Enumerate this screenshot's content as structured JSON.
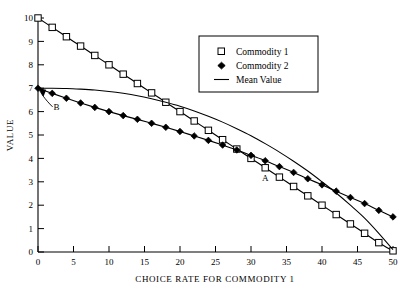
{
  "chart_data": {
    "type": "line",
    "title": "",
    "xlabel": "CHOICE RATE FOR COMMODITY 1",
    "ylabel": "VALUE",
    "xlim": [
      0,
      50
    ],
    "ylim": [
      0,
      10
    ],
    "xticks": [
      "0",
      "5",
      "10",
      "15",
      "20",
      "25",
      "30",
      "35",
      "40",
      "45",
      "50"
    ],
    "yticks": [
      "0",
      "1",
      "2",
      "3",
      "4",
      "5",
      "6",
      "7",
      "8",
      "9",
      "10"
    ],
    "grid": false,
    "legend_position": "upper-right",
    "x": [
      0,
      2,
      4,
      6,
      8,
      10,
      12,
      14,
      16,
      18,
      20,
      22,
      24,
      26,
      28,
      30,
      32,
      34,
      36,
      38,
      40,
      42,
      44,
      46,
      48,
      50
    ],
    "series": [
      {
        "name": "Commodity 1",
        "marker": "open-square",
        "values": [
          10.0,
          9.6,
          9.2,
          8.8,
          8.4,
          8.0,
          7.6,
          7.2,
          6.8,
          6.4,
          6.0,
          5.6,
          5.2,
          4.8,
          4.4,
          4.0,
          3.6,
          3.2,
          2.8,
          2.4,
          2.0,
          1.6,
          1.2,
          0.8,
          0.4,
          0.05
        ]
      },
      {
        "name": "Commodity 2",
        "marker": "filled-diamond",
        "values": [
          7.0,
          6.78,
          6.57,
          6.37,
          6.18,
          6.0,
          5.83,
          5.67,
          5.5,
          5.33,
          5.15,
          4.96,
          4.77,
          4.57,
          4.36,
          4.13,
          3.9,
          3.65,
          3.4,
          3.13,
          2.87,
          2.6,
          2.33,
          2.07,
          1.78,
          1.5
        ]
      },
      {
        "name": "Mean Value",
        "marker": "none",
        "values": [
          7.0,
          7.0,
          6.99,
          6.96,
          6.92,
          6.86,
          6.78,
          6.68,
          6.55,
          6.4,
          6.23,
          6.03,
          5.8,
          5.55,
          5.27,
          4.97,
          4.63,
          4.27,
          3.88,
          3.46,
          3.0,
          2.52,
          2.0,
          1.45,
          0.8,
          0.1
        ]
      }
    ],
    "annotations": [
      {
        "label": "A",
        "x": 32.0,
        "y": 3.02,
        "note": "crossover of commodity curves"
      },
      {
        "label": "B",
        "x": 2.6,
        "y": 6.05,
        "note": "arrow to common origin at value 7"
      }
    ]
  },
  "legend": {
    "items": [
      {
        "label": "Commodity 1",
        "marker": "open-square-marker"
      },
      {
        "label": "Commodity 2",
        "marker": "filled-diamond-marker"
      },
      {
        "label": "Mean Value",
        "marker": "line-marker"
      }
    ]
  }
}
